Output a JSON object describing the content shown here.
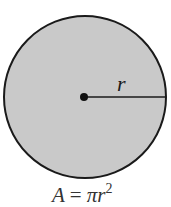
{
  "diagram": {
    "shape": "circle",
    "fill_color": "#c9c9c9",
    "stroke_color": "#1a1a1a",
    "center": {
      "x": 84,
      "y": 97
    },
    "radius_px": 81,
    "radius_label": "r",
    "formula": {
      "lhs": "A",
      "equals": "=",
      "pi": "π",
      "var": "r",
      "exponent": "2"
    }
  }
}
